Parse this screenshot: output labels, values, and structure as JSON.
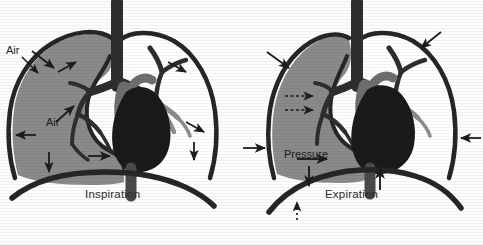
{
  "figure": {
    "colors": {
      "outline": "#262626",
      "lung_shaded": "#8a8a8a",
      "lung_clear": "#ffffff",
      "heart": "#1a1a1a",
      "great_vessel": "#6e6e6e",
      "bronchi_dark": "#2e2e2e",
      "bronchi_gray": "#8d8d8d",
      "background": "#fdfdfd",
      "text": "#1d1d1d"
    }
  },
  "panels": [
    {
      "id": "inspiration",
      "caption": "Inspiration",
      "annotations": [
        {
          "id": "air-top",
          "label": "Air"
        },
        {
          "id": "air-mid",
          "label": "Air"
        }
      ],
      "arrows": [
        {
          "name": "air-inflow-upper",
          "direction": "down-right",
          "style": "solid"
        },
        {
          "name": "chest-wall-expansion-upper-left",
          "direction": "up-right",
          "style": "solid"
        },
        {
          "name": "air-inflow-lower",
          "direction": "up-right",
          "style": "solid"
        },
        {
          "name": "chest-wall-expansion-left",
          "direction": "left",
          "style": "solid"
        },
        {
          "name": "diaphragm-descent-left",
          "direction": "down",
          "style": "solid"
        },
        {
          "name": "diaphragm-descent-center",
          "direction": "right",
          "style": "solid"
        },
        {
          "name": "chest-wall-expansion-upper-right",
          "direction": "down-right",
          "style": "solid"
        },
        {
          "name": "chest-wall-expansion-right",
          "direction": "down-right",
          "style": "solid"
        },
        {
          "name": "diaphragm-descent-right",
          "direction": "down",
          "style": "solid"
        }
      ]
    },
    {
      "id": "expiration",
      "caption": "Expiration",
      "annotations": [
        {
          "id": "pressure",
          "label": "Pressure"
        }
      ],
      "arrows": [
        {
          "name": "chest-wall-recoil-upper-left",
          "direction": "down-right",
          "style": "solid"
        },
        {
          "name": "chest-wall-recoil-left",
          "direction": "right",
          "style": "solid"
        },
        {
          "name": "air-outflow-upper",
          "direction": "right",
          "style": "dashed"
        },
        {
          "name": "air-outflow-lower",
          "direction": "right",
          "style": "dashed"
        },
        {
          "name": "pressure-arrow-right",
          "direction": "right",
          "style": "solid"
        },
        {
          "name": "pressure-arrow-down",
          "direction": "down",
          "style": "solid"
        },
        {
          "name": "diaphragm-ascent-dotted",
          "direction": "up",
          "style": "dotted"
        },
        {
          "name": "diaphragm-ascent-center",
          "direction": "up",
          "style": "solid"
        },
        {
          "name": "chest-wall-recoil-upper-right",
          "direction": "down-left",
          "style": "solid"
        },
        {
          "name": "chest-wall-recoil-right",
          "direction": "left",
          "style": "solid"
        }
      ]
    }
  ]
}
